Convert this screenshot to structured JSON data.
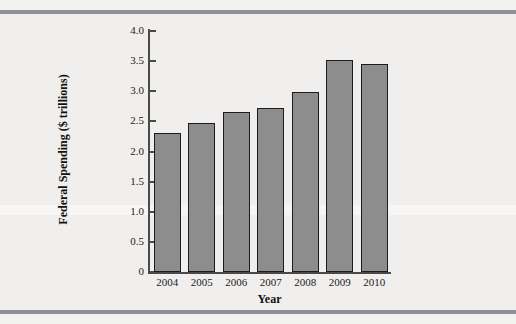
{
  "chart_data": {
    "type": "bar",
    "title": "",
    "subtitle": "",
    "xlabel": "Year",
    "ylabel": "Federal Spending ($ trillions)",
    "categories": [
      "2004",
      "2005",
      "2006",
      "2007",
      "2008",
      "2009",
      "2010"
    ],
    "values": [
      2.3,
      2.47,
      2.66,
      2.73,
      2.98,
      3.52,
      3.46
    ],
    "series": [
      {
        "name": "Federal Spending",
        "values": [
          2.3,
          2.47,
          2.66,
          2.73,
          2.98,
          3.52,
          3.46
        ]
      }
    ],
    "ylim": [
      0,
      4.0
    ],
    "ytick_labels": [
      "4.0",
      "3.5",
      "3.0",
      "2.5",
      "2.0",
      "1.5",
      "1.0",
      "0.5",
      "0"
    ],
    "ytick_values": [
      4.0,
      3.5,
      3.0,
      2.5,
      2.0,
      1.5,
      1.0,
      0.5,
      0
    ],
    "grid": false,
    "legend": null,
    "legend_position": "none",
    "bar_color": "#8d8d8d",
    "bar_edge_color": "#1c1c1c",
    "axis_color": "#4a4a4a",
    "background_color": "#f0efed",
    "rule_color": "#8e9296",
    "annotations": []
  }
}
